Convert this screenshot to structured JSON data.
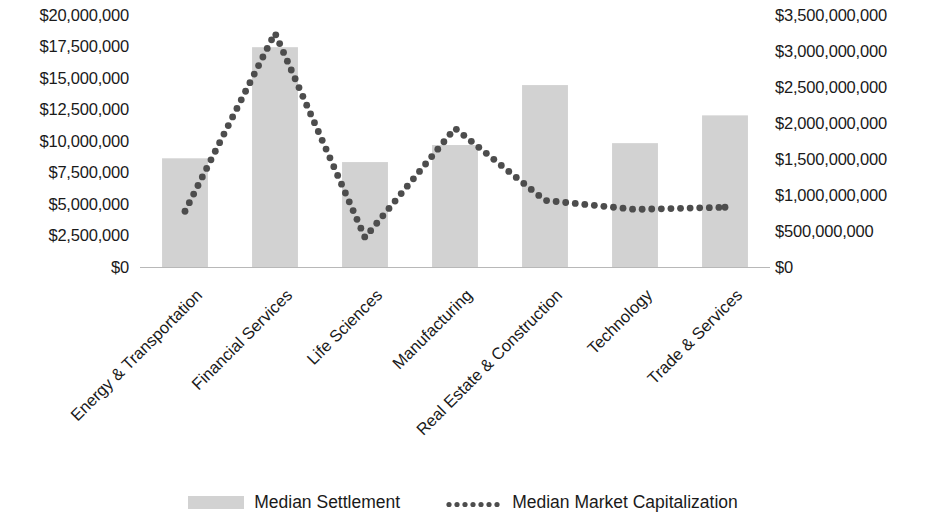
{
  "chart_data": {
    "type": "bar",
    "title": "",
    "subtitle": "",
    "xlabel": "",
    "categories": [
      "Energy & Transportation",
      "Financial Services",
      "Life Sciences",
      "Manufacturing",
      "Real Estate & Construction",
      "Technology",
      "Trade & Services"
    ],
    "series": [
      {
        "name": "Median Settlement",
        "type": "bar",
        "axis": "left",
        "color": "#d2d2d2",
        "values": [
          8650000,
          17450000,
          8350000,
          9700000,
          14450000,
          9850000,
          12050000
        ]
      },
      {
        "name": "Median Market Capitalization",
        "type": "line",
        "style": "dotted",
        "axis": "right",
        "color": "#4d4d4d",
        "values": [
          780000000,
          3250000000,
          415000000,
          1930000000,
          930000000,
          805000000,
          835000000
        ]
      }
    ],
    "left_axis": {
      "label": "",
      "ylim": [
        0,
        20000000
      ],
      "tick_values": [
        20000000,
        17500000,
        15000000,
        12500000,
        10000000,
        7500000,
        5000000,
        2500000,
        0
      ],
      "tick_labels": [
        "$20,000,000",
        "$17,500,000",
        "$15,000,000",
        "$12,500,000",
        "$10,000,000",
        "$7,500,000",
        "$5,000,000",
        "$2,500,000",
        "$0"
      ]
    },
    "right_axis": {
      "label": "",
      "ylim": [
        0,
        3500000000
      ],
      "tick_values": [
        3500000000,
        3000000000,
        2500000000,
        2000000000,
        1500000000,
        1000000000,
        500000000,
        0
      ],
      "tick_labels": [
        "$3,500,000,000",
        "$3,000,000,000",
        "$2,500,000,000",
        "$2,000,000,000",
        "$1,500,000,000",
        "$1,000,000,000",
        "$500,000,000",
        "$0"
      ]
    },
    "grid": false,
    "legend": {
      "position": "bottom",
      "entries": [
        {
          "label": "Median Settlement",
          "marker": "bar-swatch",
          "color": "#d2d2d2"
        },
        {
          "label": "Median Market Capitalization",
          "marker": "dotted-line",
          "color": "#4d4d4d"
        }
      ]
    }
  }
}
